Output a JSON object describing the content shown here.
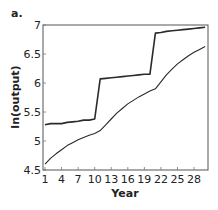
{
  "panel_label": "a.",
  "chart_data": {
    "type": "line",
    "title": "",
    "xlabel": "Year",
    "ylabel": "ln(output)",
    "xlim": [
      1,
      30
    ],
    "ylim": [
      4.5,
      7
    ],
    "xticks": [
      1,
      4,
      7,
      10,
      13,
      16,
      19,
      22,
      25,
      28
    ],
    "yticks": [
      4.5,
      5,
      5.5,
      6,
      6.5,
      7
    ],
    "ytick_labels": [
      "4.5",
      "5",
      "5.5",
      "6",
      "6.5",
      "7"
    ],
    "grid": false,
    "legend": null,
    "x": [
      1,
      2,
      3,
      4,
      5,
      6,
      7,
      8,
      9,
      10,
      11,
      12,
      13,
      14,
      15,
      16,
      17,
      18,
      19,
      20,
      21,
      22,
      23,
      24,
      25,
      26,
      27,
      28,
      29,
      30
    ],
    "series": [
      {
        "name": "upper (step)",
        "stroke_width": 1.6,
        "values": [
          5.28,
          5.3,
          5.3,
          5.3,
          5.32,
          5.33,
          5.34,
          5.36,
          5.36,
          5.38,
          6.07,
          6.08,
          6.09,
          6.1,
          6.11,
          6.12,
          6.13,
          6.14,
          6.15,
          6.15,
          6.86,
          6.87,
          6.89,
          6.9,
          6.91,
          6.92,
          6.93,
          6.94,
          6.95,
          6.96
        ]
      },
      {
        "name": "lower (smooth)",
        "stroke_width": 1.1,
        "values": [
          4.6,
          4.7,
          4.78,
          4.85,
          4.92,
          4.97,
          5.02,
          5.06,
          5.1,
          5.13,
          5.18,
          5.28,
          5.38,
          5.48,
          5.56,
          5.64,
          5.7,
          5.76,
          5.81,
          5.86,
          5.9,
          6.02,
          6.14,
          6.24,
          6.33,
          6.4,
          6.47,
          6.53,
          6.58,
          6.63
        ]
      }
    ]
  }
}
